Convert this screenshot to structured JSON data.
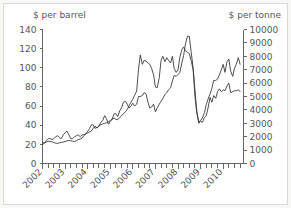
{
  "figure": {
    "background_color": "#f7f7f5",
    "plot_background_color": "#ffffff",
    "border_color": "#d8d8d8",
    "line_color": "#3a3a3a",
    "text_color": "#555555"
  },
  "left_axis_title": "$ per barrel",
  "right_axis_title": "$ per tonne",
  "chart_data": {
    "type": "line",
    "title": "",
    "subtitle": "",
    "xlabel": "",
    "ylabel": "$ per barrel",
    "y2label": "$ per tonne",
    "grid": false,
    "legend": "none",
    "xlim": [
      2002.0,
      2010.9
    ],
    "ylim": [
      0,
      140
    ],
    "y2lim": [
      0,
      10000
    ],
    "left_ticks": [
      0,
      20,
      40,
      60,
      80,
      100,
      120,
      140
    ],
    "right_ticks": [
      0,
      1000,
      2000,
      3000,
      4000,
      5000,
      6000,
      7000,
      8000,
      9000,
      10000
    ],
    "x_ticks_labeled": [
      "2002",
      "2003",
      "2004",
      "2005",
      "2006",
      "2007",
      "2008",
      "2009",
      "2010"
    ],
    "x_tick_label_rotation_deg": -45,
    "x_minor_tick_interval_years": 0.25,
    "series": [
      {
        "name": "copper-price-dollars-per-tonne",
        "axis": "right",
        "units": "$ per tonne",
        "x": [
          2002.0,
          2002.08,
          2002.17,
          2002.25,
          2002.33,
          2002.42,
          2002.5,
          2002.58,
          2002.67,
          2002.75,
          2002.83,
          2002.92,
          2003.0,
          2003.08,
          2003.17,
          2003.25,
          2003.33,
          2003.42,
          2003.5,
          2003.58,
          2003.67,
          2003.75,
          2003.83,
          2003.92,
          2004.0,
          2004.08,
          2004.17,
          2004.25,
          2004.33,
          2004.42,
          2004.5,
          2004.58,
          2004.67,
          2004.75,
          2004.83,
          2004.92,
          2005.0,
          2005.08,
          2005.17,
          2005.25,
          2005.33,
          2005.42,
          2005.5,
          2005.58,
          2005.67,
          2005.75,
          2005.83,
          2005.92,
          2006.0,
          2006.08,
          2006.17,
          2006.25,
          2006.33,
          2006.42,
          2006.5,
          2006.58,
          2006.67,
          2006.75,
          2006.83,
          2006.92,
          2007.0,
          2007.08,
          2007.17,
          2007.25,
          2007.33,
          2007.42,
          2007.5,
          2007.58,
          2007.67,
          2007.75,
          2007.83,
          2007.92,
          2008.0,
          2008.08,
          2008.17,
          2008.25,
          2008.33,
          2008.42,
          2008.5,
          2008.58,
          2008.67,
          2008.75,
          2008.83,
          2008.92,
          2009.0,
          2009.08,
          2009.17,
          2009.25,
          2009.33,
          2009.42,
          2009.5,
          2009.58,
          2009.67,
          2009.75,
          2009.83,
          2009.92,
          2010.0,
          2010.08,
          2010.17,
          2010.25,
          2010.33,
          2010.42,
          2010.5,
          2010.58,
          2010.67,
          2010.75
        ],
        "values": [
          1560,
          1540,
          1600,
          1660,
          1640,
          1620,
          1560,
          1520,
          1500,
          1540,
          1580,
          1600,
          1640,
          1680,
          1720,
          1700,
          1660,
          1640,
          1700,
          1780,
          1820,
          1900,
          2080,
          2220,
          2400,
          2600,
          2900,
          2880,
          2620,
          2700,
          2820,
          2880,
          2960,
          3000,
          3040,
          3120,
          3200,
          3320,
          3380,
          3300,
          3260,
          3440,
          3560,
          3700,
          3860,
          4020,
          4300,
          4580,
          4800,
          5100,
          5400,
          7000,
          8100,
          7400,
          7700,
          7650,
          7500,
          7400,
          7100,
          6600,
          5700,
          5650,
          6400,
          7700,
          8000,
          7600,
          7900,
          7700,
          7500,
          8000,
          7100,
          6800,
          7000,
          7900,
          8500,
          8700,
          8400,
          8300,
          8200,
          7700,
          7000,
          5000,
          3800,
          3100,
          3200,
          3400,
          3800,
          4400,
          4800,
          5200,
          5600,
          6200,
          6200,
          6300,
          6600,
          7000,
          7400,
          6800,
          7600,
          7800,
          6900,
          6500,
          7100,
          7400,
          7900,
          7400
        ]
      },
      {
        "name": "crude-oil-price-dollars-per-barrel",
        "axis": "left",
        "units": "$ per barrel",
        "x": [
          2002.0,
          2002.08,
          2002.17,
          2002.25,
          2002.33,
          2002.42,
          2002.5,
          2002.58,
          2002.67,
          2002.75,
          2002.83,
          2002.92,
          2003.0,
          2003.08,
          2003.17,
          2003.25,
          2003.33,
          2003.42,
          2003.5,
          2003.58,
          2003.67,
          2003.75,
          2003.83,
          2003.92,
          2004.0,
          2004.08,
          2004.17,
          2004.25,
          2004.33,
          2004.42,
          2004.5,
          2004.58,
          2004.67,
          2004.75,
          2004.83,
          2004.92,
          2005.0,
          2005.08,
          2005.17,
          2005.25,
          2005.33,
          2005.42,
          2005.5,
          2005.58,
          2005.67,
          2005.75,
          2005.83,
          2005.92,
          2006.0,
          2006.08,
          2006.17,
          2006.25,
          2006.33,
          2006.42,
          2006.5,
          2006.58,
          2006.67,
          2006.75,
          2006.83,
          2006.92,
          2007.0,
          2007.08,
          2007.17,
          2007.25,
          2007.33,
          2007.42,
          2007.5,
          2007.58,
          2007.67,
          2007.75,
          2007.83,
          2007.92,
          2008.0,
          2008.08,
          2008.17,
          2008.25,
          2008.33,
          2008.42,
          2008.5,
          2008.58,
          2008.67,
          2008.75,
          2008.83,
          2008.92,
          2009.0,
          2009.08,
          2009.17,
          2009.25,
          2009.33,
          2009.42,
          2009.5,
          2009.58,
          2009.67,
          2009.75,
          2009.83,
          2009.92,
          2010.0,
          2010.08,
          2010.17,
          2010.25,
          2010.33,
          2010.42,
          2010.5,
          2010.58,
          2010.67,
          2010.75
        ],
        "values": [
          20,
          21,
          24,
          26,
          26,
          25,
          26,
          28,
          29,
          27,
          26,
          30,
          32,
          34,
          30,
          26,
          26,
          28,
          29,
          30,
          28,
          30,
          30,
          31,
          32,
          33,
          34,
          37,
          39,
          37,
          39,
          43,
          45,
          50,
          47,
          41,
          44,
          46,
          52,
          52,
          49,
          55,
          58,
          64,
          65,
          62,
          58,
          60,
          63,
          60,
          62,
          70,
          70,
          71,
          74,
          73,
          64,
          58,
          59,
          62,
          54,
          58,
          62,
          65,
          68,
          72,
          74,
          77,
          79,
          86,
          92,
          91,
          93,
          95,
          105,
          113,
          125,
          133,
          133,
          117,
          100,
          77,
          55,
          42,
          44,
          43,
          48,
          50,
          58,
          69,
          64,
          71,
          68,
          75,
          78,
          75,
          77,
          76,
          81,
          84,
          74,
          75,
          76,
          76,
          77,
          75
        ]
      }
    ]
  }
}
